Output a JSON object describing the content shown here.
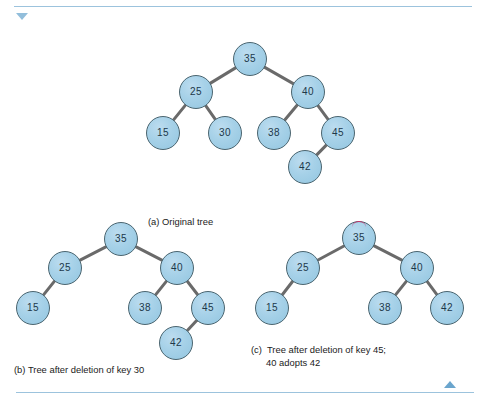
{
  "page": {
    "background_color": "#ffffff",
    "rule_color": "#9cc3dd",
    "node_fill_color": "#a6d1e8",
    "node_border_color": "#49646f",
    "node_text_color": "#20384a",
    "edge_color": "#6a6a6a",
    "marker_color": "#cf2f6a"
  },
  "nav": {
    "scroll_up_icon": "triangle-up-icon",
    "scroll_down_icon": "triangle-down-icon"
  },
  "figures": [
    {
      "id": "a",
      "caption": "(a) Original tree",
      "caption_line2": "",
      "width": 240,
      "height": 200,
      "nodes": [
        {
          "key": "35",
          "x": 118,
          "y": 24,
          "marked": false
        },
        {
          "key": "25",
          "x": 64,
          "y": 57,
          "marked": false
        },
        {
          "key": "40",
          "x": 176,
          "y": 57,
          "marked": false
        },
        {
          "key": "15",
          "x": 31,
          "y": 98,
          "marked": false
        },
        {
          "key": "30",
          "x": 93,
          "y": 98,
          "marked": false
        },
        {
          "key": "38",
          "x": 142,
          "y": 98,
          "marked": false
        },
        {
          "key": "45",
          "x": 206,
          "y": 98,
          "marked": false
        },
        {
          "key": "42",
          "x": 173,
          "y": 132,
          "marked": false
        }
      ],
      "edges": [
        {
          "from": "35",
          "to": "25"
        },
        {
          "from": "35",
          "to": "40"
        },
        {
          "from": "25",
          "to": "15"
        },
        {
          "from": "25",
          "to": "30"
        },
        {
          "from": "40",
          "to": "38"
        },
        {
          "from": "40",
          "to": "45"
        },
        {
          "from": "45",
          "to": "42"
        }
      ]
    },
    {
      "id": "b",
      "caption": "(b) Tree after deletion of key 30",
      "caption_line2": "",
      "width": 230,
      "height": 150,
      "nodes": [
        {
          "key": "35",
          "x": 113,
          "y": 24,
          "marked": false
        },
        {
          "key": "25",
          "x": 57,
          "y": 53,
          "marked": false
        },
        {
          "key": "40",
          "x": 169,
          "y": 53,
          "marked": false
        },
        {
          "key": "15",
          "x": 25,
          "y": 93,
          "marked": false
        },
        {
          "key": "38",
          "x": 137,
          "y": 93,
          "marked": false
        },
        {
          "key": "45",
          "x": 200,
          "y": 93,
          "marked": false
        },
        {
          "key": "42",
          "x": 168,
          "y": 128,
          "marked": false
        }
      ],
      "edges": [
        {
          "from": "35",
          "to": "25"
        },
        {
          "from": "35",
          "to": "40"
        },
        {
          "from": "25",
          "to": "15"
        },
        {
          "from": "40",
          "to": "38"
        },
        {
          "from": "40",
          "to": "45"
        },
        {
          "from": "45",
          "to": "42"
        }
      ]
    },
    {
      "id": "c",
      "caption": "(c)  Tree after deletion of key 45;",
      "caption_line2": "40 adopts 42",
      "width": 200,
      "height": 115,
      "nodes": [
        {
          "key": "35",
          "x": 108,
          "y": 23,
          "marked": true
        },
        {
          "key": "25",
          "x": 52,
          "y": 53,
          "marked": false
        },
        {
          "key": "40",
          "x": 166,
          "y": 53,
          "marked": false
        },
        {
          "key": "15",
          "x": 21,
          "y": 93,
          "marked": false
        },
        {
          "key": "38",
          "x": 134,
          "y": 93,
          "marked": false
        },
        {
          "key": "42",
          "x": 196,
          "y": 93,
          "marked": false
        }
      ],
      "edges": [
        {
          "from": "35",
          "to": "25"
        },
        {
          "from": "35",
          "to": "40"
        },
        {
          "from": "25",
          "to": "15"
        },
        {
          "from": "40",
          "to": "38"
        },
        {
          "from": "40",
          "to": "42"
        }
      ]
    }
  ],
  "figure_positions": [
    {
      "left": 132,
      "top": 35,
      "caption_left": 16,
      "caption_top": 180
    },
    {
      "left": 8,
      "top": 215,
      "caption_left": 6,
      "caption_top": 148
    },
    {
      "left": 251,
      "top": 215,
      "caption_left": 0,
      "caption_top": 128
    }
  ]
}
